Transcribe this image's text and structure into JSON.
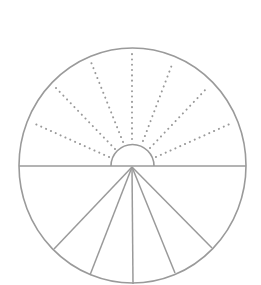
{
  "diagram": {
    "colors": {
      "stroke": "#9a9a9a",
      "background": "#ffffff"
    },
    "outer_circle": {
      "cx": 132.5,
      "cy": 165.5,
      "rx": 113.5,
      "ry": 117.5
    },
    "diameter": {
      "x1": 19,
      "y1": 166,
      "x2": 246,
      "y2": 166
    },
    "inner_semicircle": {
      "cx": 132.5,
      "cy": 166,
      "r": 21.5
    },
    "dotted_rays": [
      {
        "x1": 109,
        "y1": 157,
        "x2": 33,
        "y2": 123
      },
      {
        "x1": 115,
        "y1": 149,
        "x2": 56,
        "y2": 88
      },
      {
        "x1": 123,
        "y1": 142,
        "x2": 91,
        "y2": 62
      },
      {
        "x1": 132,
        "y1": 139,
        "x2": 132,
        "y2": 54
      },
      {
        "x1": 143,
        "y1": 141,
        "x2": 173,
        "y2": 62
      },
      {
        "x1": 150,
        "y1": 148,
        "x2": 208,
        "y2": 87
      },
      {
        "x1": 156,
        "y1": 157,
        "x2": 232,
        "y2": 123
      }
    ],
    "solid_rays": [
      {
        "x1": 132,
        "y1": 167,
        "x2": 54,
        "y2": 249
      },
      {
        "x1": 132,
        "y1": 167,
        "x2": 90,
        "y2": 275
      },
      {
        "x1": 132,
        "y1": 167,
        "x2": 133,
        "y2": 284
      },
      {
        "x1": 132,
        "y1": 167,
        "x2": 175,
        "y2": 273
      },
      {
        "x1": 132,
        "y1": 167,
        "x2": 212,
        "y2": 248
      }
    ]
  }
}
